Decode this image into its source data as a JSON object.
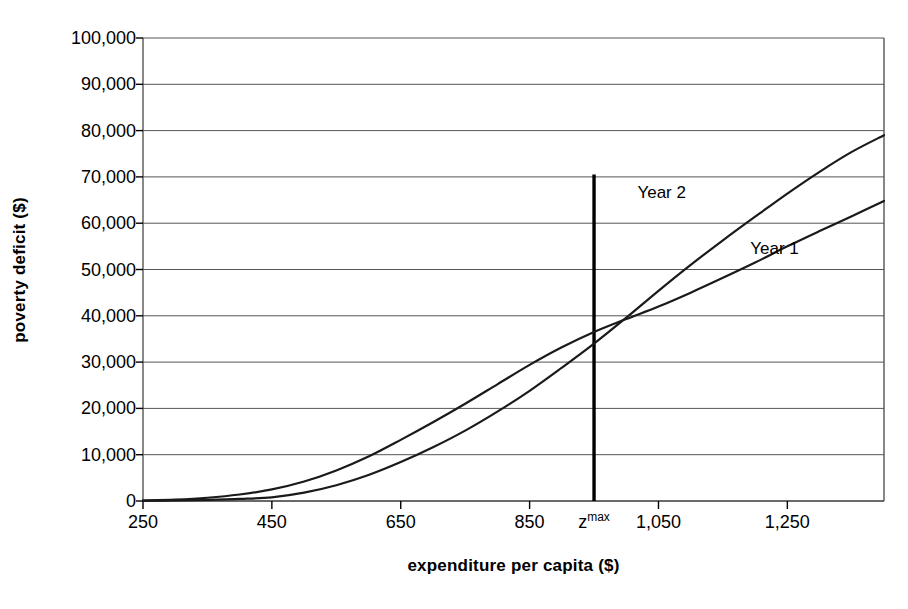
{
  "chart_data": {
    "type": "line",
    "title": "",
    "xlabel": "expenditure per capita ($)",
    "ylabel": "poverty deficit ($)",
    "xlim": [
      250,
      1400
    ],
    "ylim": [
      0,
      100000
    ],
    "grid": "horizontal",
    "legend_position": "inline-annotations",
    "y_ticks": [
      {
        "value": 100000,
        "label": "100,000"
      },
      {
        "value": 90000,
        "label": "90,000"
      },
      {
        "value": 80000,
        "label": "80,000"
      },
      {
        "value": 70000,
        "label": "70,000"
      },
      {
        "value": 60000,
        "label": "60,000"
      },
      {
        "value": 50000,
        "label": "50,000"
      },
      {
        "value": 40000,
        "label": "40,000"
      },
      {
        "value": 30000,
        "label": "30,000"
      },
      {
        "value": 20000,
        "label": "20,000"
      },
      {
        "value": 10000,
        "label": "10,000"
      },
      {
        "value": 0,
        "label": "0"
      }
    ],
    "x_ticks": [
      {
        "value": 250,
        "label": "250",
        "sup": ""
      },
      {
        "value": 450,
        "label": "450",
        "sup": ""
      },
      {
        "value": 650,
        "label": "650",
        "sup": ""
      },
      {
        "value": 850,
        "label": "850",
        "sup": ""
      },
      {
        "value": 950,
        "label": "z",
        "sup": "max"
      },
      {
        "value": 1050,
        "label": "1,050",
        "sup": ""
      },
      {
        "value": 1250,
        "label": "1,250",
        "sup": ""
      }
    ],
    "annotations": [
      {
        "text": "Year 2",
        "x": 1055,
        "y": 66500
      },
      {
        "text": "Year 1",
        "x": 1230,
        "y": 54500
      }
    ],
    "markers": [
      {
        "name": "z-max-line",
        "type": "vline",
        "x": 950,
        "y_from": 0,
        "y_to": 70500,
        "color": "#000000"
      }
    ],
    "series": [
      {
        "name": "Year 1",
        "color": "#1a1a1a",
        "x": [
          250,
          300,
          350,
          400,
          450,
          500,
          550,
          600,
          650,
          700,
          750,
          800,
          850,
          900,
          950,
          1000,
          1050,
          1100,
          1150,
          1200,
          1250,
          1300,
          1350,
          1400
        ],
        "y": [
          100,
          300,
          700,
          1400,
          2500,
          4200,
          6600,
          9600,
          13200,
          17000,
          21000,
          25200,
          29400,
          33200,
          36500,
          39300,
          42000,
          45000,
          48200,
          51500,
          55000,
          58300,
          61500,
          64800
        ]
      },
      {
        "name": "Year 2",
        "color": "#1a1a1a",
        "x": [
          250,
          300,
          350,
          400,
          450,
          500,
          550,
          600,
          650,
          700,
          750,
          800,
          850,
          900,
          950,
          1000,
          1050,
          1100,
          1150,
          1200,
          1250,
          1300,
          1350,
          1400
        ],
        "y": [
          60,
          120,
          250,
          450,
          800,
          1800,
          3400,
          5600,
          8400,
          11600,
          15200,
          19300,
          23800,
          28800,
          34000,
          39600,
          45400,
          51000,
          56300,
          61400,
          66400,
          71100,
          75400,
          79000
        ]
      }
    ]
  }
}
